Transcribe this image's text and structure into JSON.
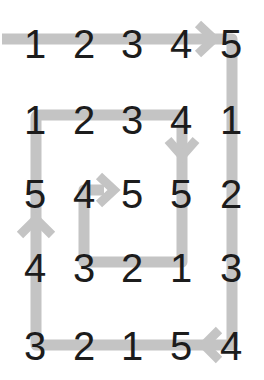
{
  "colors": {
    "path": "#c4c4c4",
    "digit": "#1c1c1c",
    "background": "#ffffff"
  },
  "grid": {
    "rows": [
      [
        "1",
        "2",
        "3",
        "4",
        "5"
      ],
      [
        "1",
        "2",
        "3",
        "4",
        "1"
      ],
      [
        "5",
        "4",
        "5",
        "5",
        "2"
      ],
      [
        "4",
        "3",
        "2",
        "1",
        "3"
      ],
      [
        "3",
        "2",
        "1",
        "5",
        "4"
      ]
    ]
  },
  "path": {
    "description": "Inward spiral starting at top-left, going right along the top row, down the right column, left along the bottom row, up the left column, right along row 2, down column 4, left along row 4, up column 2, ending pointing right at row 3 center",
    "arrows": [
      {
        "position": "between row1 col4 and col5",
        "direction": "right"
      },
      {
        "position": "right of row5 col4",
        "direction": "left"
      },
      {
        "position": "between row3 and row4 col1",
        "direction": "up"
      },
      {
        "position": "between row2 and row3 col4",
        "direction": "down"
      },
      {
        "position": "between row3 col2 and col3",
        "direction": "right"
      }
    ]
  }
}
